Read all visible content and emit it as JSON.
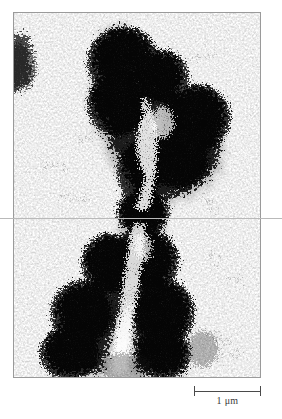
{
  "figure": {
    "kind": "electron-micrograph",
    "panel": {
      "frame_color": "#9a9a9a",
      "background_color": "#ffffff",
      "stain_color": "#111111",
      "x": 13,
      "y": 12,
      "width": 248,
      "height": 366
    },
    "guide_line": {
      "orientation": "horizontal",
      "y": 218,
      "color": "#b9b9b9"
    },
    "scale_bar": {
      "label": "1 μm",
      "value": 1,
      "unit": "μm",
      "length_px": 67,
      "line_color": "#4a4a4a",
      "cap_style": "serif-ends"
    },
    "structures": [
      {
        "name": "sister-chromatid-left",
        "label": "left chromatid"
      },
      {
        "name": "sister-chromatid-right",
        "label": "right chromatid"
      },
      {
        "name": "centromere",
        "label": "primary constriction"
      },
      {
        "name": "background-debris",
        "label": "stain debris"
      }
    ]
  }
}
